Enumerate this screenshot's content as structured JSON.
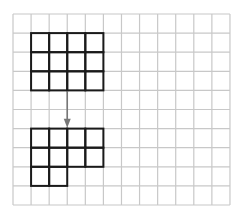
{
  "diagram": {
    "type": "grid-translation",
    "grid": {
      "columns": 12,
      "rows": 10,
      "origin_x": 13,
      "origin_y": 14,
      "cell_width": 18.08,
      "cell_height": 19.1,
      "line_color": "#c8c8c8",
      "line_width": 1.2
    },
    "shapes": [
      {
        "name": "original-shape",
        "stroke": "#1a1a1a",
        "stroke_width": 2,
        "cells": [
          [
            1,
            1
          ],
          [
            2,
            1
          ],
          [
            3,
            1
          ],
          [
            4,
            1
          ],
          [
            1,
            2
          ],
          [
            2,
            2
          ],
          [
            3,
            2
          ],
          [
            4,
            2
          ],
          [
            1,
            3
          ],
          [
            2,
            3
          ],
          [
            3,
            3
          ],
          [
            4,
            3
          ]
        ]
      },
      {
        "name": "translated-shape",
        "stroke": "#1a1a1a",
        "stroke_width": 2,
        "cells": [
          [
            1,
            6
          ],
          [
            2,
            6
          ],
          [
            3,
            6
          ],
          [
            4,
            6
          ],
          [
            1,
            7
          ],
          [
            2,
            7
          ],
          [
            3,
            7
          ],
          [
            4,
            7
          ],
          [
            1,
            8
          ],
          [
            2,
            8
          ]
        ]
      }
    ],
    "arrow": {
      "direction": "down",
      "color": "#777777",
      "grid_x": 3,
      "from_grid_y": 4.05,
      "to_grid_y": 5.95
    }
  }
}
